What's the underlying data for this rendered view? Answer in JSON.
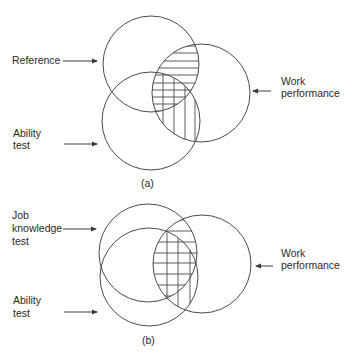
{
  "figure_a": {
    "caption": "(a)",
    "labels": {
      "reference": "Reference",
      "ability_line1": "Ability",
      "ability_line2": "test",
      "work_line1": "Work",
      "work_line2": "performance"
    },
    "circles": [
      {
        "name": "Reference",
        "cx": 151,
        "cy": 64,
        "r": 48
      },
      {
        "name": "Work performance",
        "cx": 201,
        "cy": 93,
        "r": 49
      },
      {
        "name": "Ability test",
        "cx": 151,
        "cy": 121,
        "r": 49
      }
    ]
  },
  "figure_b": {
    "caption": "(b)",
    "labels": {
      "job_line1": "Job",
      "job_line2": "knowledge",
      "job_line3": "test",
      "ability_line1": "Ability",
      "ability_line2": "test",
      "work_line1": "Work",
      "work_line2": "performance"
    },
    "circles": [
      {
        "name": "Job knowledge test",
        "cx": 148,
        "cy": 253,
        "r": 49
      },
      {
        "name": "Work performance",
        "cx": 202,
        "cy": 264,
        "r": 49
      },
      {
        "name": "Ability test",
        "cx": 149,
        "cy": 277,
        "r": 49
      }
    ]
  },
  "colors": {
    "stroke": "#4a4a4a",
    "text": "#2a2a2a",
    "background": "#ffffff"
  }
}
